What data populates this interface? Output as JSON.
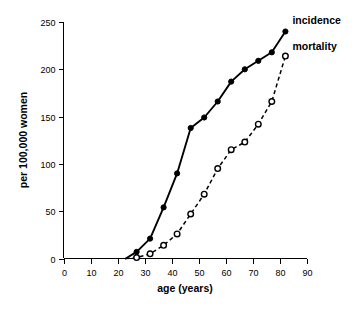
{
  "chart_data": {
    "type": "line",
    "title": "",
    "xlabel": "age (years)",
    "ylabel": "per 100,000 women",
    "xlim": [
      0,
      90
    ],
    "ylim": [
      0,
      250
    ],
    "xticks": [
      0,
      10,
      20,
      30,
      40,
      50,
      60,
      70,
      80,
      90
    ],
    "xtick_labels": [
      "0",
      "10",
      "20",
      "30",
      "40",
      "50",
      "60",
      "70",
      "80",
      "90"
    ],
    "yticks": [
      0,
      50,
      100,
      150,
      200,
      250
    ],
    "ytick_labels": [
      "0",
      "50",
      "100",
      "150",
      "200",
      "250"
    ],
    "grid": false,
    "legend_position": "inline-right-of-curve-ends",
    "series": [
      {
        "name": "incidence",
        "label": "incidence",
        "marker": "filled-circle",
        "linestyle": "solid",
        "color": "#000000",
        "x": [
          23,
          27,
          32,
          37,
          42,
          47,
          52,
          57,
          62,
          67,
          72,
          77,
          82
        ],
        "values": [
          0,
          7,
          21,
          54,
          90,
          138,
          149,
          166,
          187,
          200,
          209,
          218,
          240
        ]
      },
      {
        "name": "mortality",
        "label": "mortality",
        "marker": "open-circle",
        "linestyle": "dashed",
        "color": "#000000",
        "x": [
          23,
          27,
          32,
          37,
          42,
          47,
          52,
          57,
          62,
          67,
          72,
          77,
          82
        ],
        "values": [
          0,
          1,
          5,
          14,
          26,
          47,
          68,
          95,
          115,
          123,
          142,
          166,
          214
        ]
      }
    ]
  },
  "labels": {
    "incidence": "incidence",
    "mortality": "mortality",
    "x_axis_title": "age (years)",
    "y_axis_title": "per 100,000 women"
  }
}
